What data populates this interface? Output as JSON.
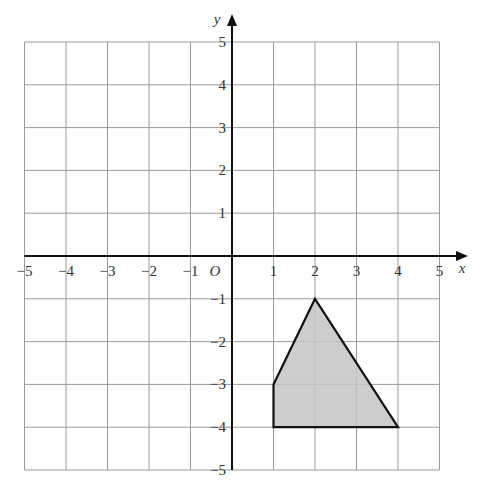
{
  "chart_data": {
    "type": "diagram",
    "title": "",
    "xlabel": "x",
    "ylabel": "y",
    "origin_label": "O",
    "xlim": [
      -5,
      5
    ],
    "ylim": [
      -5,
      5
    ],
    "grid": true,
    "x_ticks": [
      -5,
      -4,
      -3,
      -2,
      -1,
      1,
      2,
      3,
      4,
      5
    ],
    "y_ticks": [
      5,
      4,
      3,
      2,
      1,
      -1,
      -2,
      -3,
      -4,
      -5
    ],
    "shapes": [
      {
        "name": "shaded-quadrilateral",
        "vertices": [
          [
            2,
            -1
          ],
          [
            4,
            -4
          ],
          [
            1,
            -4
          ],
          [
            1,
            -3
          ]
        ],
        "fill": "#c4c4c4",
        "stroke": "#111111"
      }
    ]
  },
  "colors": {
    "grid": "#9a9a9a",
    "axis": "#111111",
    "shape_fill": "#c4c4c4",
    "label": "#333333"
  }
}
